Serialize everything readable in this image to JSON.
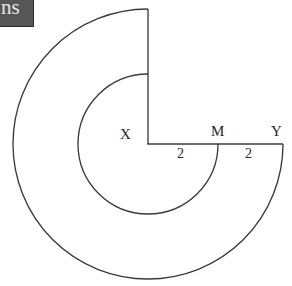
{
  "figure": {
    "kind": "geometry-diagram",
    "background_color": "#ffffff",
    "stroke_color": "#3a3a3a",
    "text_color": "#262626",
    "canvas": {
      "width": 292,
      "height": 286
    },
    "centre": {
      "name": "X",
      "x": 148,
      "y": 144
    },
    "points": [
      {
        "name": "X",
        "label": "X",
        "x": 148,
        "y": 144,
        "role": "centre"
      },
      {
        "name": "M",
        "label": "M",
        "x": 218,
        "y": 144,
        "role": "inner-radius-endpoint"
      },
      {
        "name": "Y",
        "label": "Y",
        "x": 283,
        "y": 144,
        "role": "outer-radius-endpoint"
      }
    ],
    "arcs": [
      {
        "name": "outer-arc",
        "radius": 135,
        "sweep_degrees": 270,
        "start_point": {
          "x": 148,
          "y": 9
        },
        "end_point": {
          "x": 283,
          "y": 144
        },
        "direction": "counterclockwise"
      },
      {
        "name": "inner-arc",
        "radius": 70,
        "sweep_degrees": 270,
        "start_point": {
          "x": 148,
          "y": 74
        },
        "end_point": {
          "x": 218,
          "y": 144
        },
        "direction": "counterclockwise"
      }
    ],
    "segments": [
      {
        "name": "vertical-radius",
        "from": {
          "x": 148,
          "y": 9
        },
        "to": {
          "x": 148,
          "y": 144
        }
      },
      {
        "name": "horizontal-radius",
        "from": {
          "x": 148,
          "y": 144
        },
        "to": {
          "x": 283,
          "y": 144
        }
      }
    ],
    "dimensions": [
      {
        "name": "segment-xm",
        "label": "2",
        "from": "X",
        "to": "M",
        "value": 2
      },
      {
        "name": "segment-my",
        "label": "2",
        "from": "M",
        "to": "Y",
        "value": 2
      }
    ]
  },
  "watermark": {
    "text": "ns",
    "background_color": "#565656",
    "text_color": "#e8e8e8"
  }
}
